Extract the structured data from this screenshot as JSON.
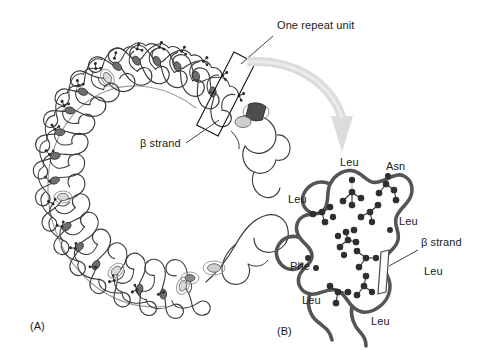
{
  "figure": {
    "background_color": "#ffffff",
    "ink_color": "#3c3c3c",
    "dark_ink_color": "#2b2b2b",
    "arrow_color": "#dcdcdc",
    "backbone_color": "#555555",
    "sidechain_color": "#2f2f2f"
  },
  "panel_a": {
    "tag": "(A)",
    "tag_x": 30,
    "tag_y": 320,
    "callout_repeat_unit": {
      "label": "One repeat unit",
      "x": 277,
      "y": 26,
      "leader_from_x": 273,
      "leader_from_y": 36,
      "leader_to_x": 241,
      "leader_to_y": 64
    },
    "callout_beta_strand": {
      "label": "β strand",
      "x": 140,
      "y": 144,
      "leader_from_x": 186,
      "leader_from_y": 143,
      "leader_to_x": 219,
      "leader_to_y": 120
    },
    "repeat_box": {
      "cx": 226,
      "cy": 94,
      "width": 24,
      "height": 82,
      "rotation_deg": 27
    }
  },
  "panel_b": {
    "tag": "(B)",
    "tag_x": 277,
    "tag_y": 325,
    "beta_strand_callout": {
      "label": "β strand",
      "x": 421,
      "y": 243,
      "leader_from_x": 418,
      "leader_from_y": 250,
      "leader_to_x": 389,
      "leader_to_y": 266
    },
    "residues": [
      {
        "label": "Leu",
        "x": 340,
        "y": 163
      },
      {
        "label": "Asn",
        "x": 386,
        "y": 167
      },
      {
        "label": "Leu",
        "x": 288,
        "y": 200
      },
      {
        "label": "Leu",
        "x": 399,
        "y": 222
      },
      {
        "label": "Phe",
        "x": 290,
        "y": 267
      },
      {
        "label": "Leu",
        "x": 424,
        "y": 272
      },
      {
        "label": "Leu",
        "x": 302,
        "y": 301
      },
      {
        "label": "Leu",
        "x": 371,
        "y": 322
      }
    ]
  },
  "transition_arrow": {
    "name": "curved-arrow-a-to-b",
    "color": "#dcdcdc",
    "from_x": 247,
    "from_y": 60,
    "to_x": 347,
    "to_y": 155
  }
}
